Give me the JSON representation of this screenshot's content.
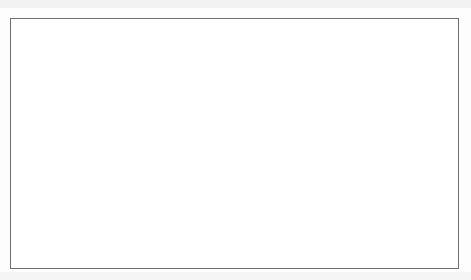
{
  "figure": {
    "background_color": "#ffffff",
    "border_color": "#6e6e6e"
  },
  "chart_data": {
    "type": "line",
    "title": "",
    "xlabel": "Year",
    "ylabel": "Rate (%)",
    "xlim": [
      1962,
      2009
    ],
    "ylim": [
      0,
      20
    ],
    "ytick_step": 2,
    "yticks": [
      0,
      2,
      4,
      6,
      8,
      10,
      12,
      14,
      16,
      18,
      20
    ],
    "xticks": [
      1962,
      1967,
      1972,
      1977,
      1982,
      1987,
      1992,
      1997,
      2002,
      2007
    ],
    "grid": false,
    "legend_position": "top-right",
    "x": [
      1962,
      1963,
      1964,
      1965,
      1966,
      1967,
      1968,
      1969,
      1970,
      1971,
      1972,
      1973,
      1974,
      1975,
      1976,
      1977,
      1978,
      1979,
      1980,
      1981,
      1982,
      1983,
      1984,
      1985,
      1986,
      1987,
      1988,
      1989,
      1990,
      1991,
      1992,
      1993,
      1994,
      1995,
      1996,
      1997,
      1998,
      1999,
      2000,
      2001,
      2002,
      2003,
      2004,
      2005,
      2006,
      2007,
      2008,
      2009
    ],
    "series": [
      {
        "name": "Inflation Rate",
        "color": "#1a1a1a",
        "marker": "diamond",
        "values": [
          1.7,
          1.7,
          2.0,
          3.2,
          3.4,
          4.1,
          3.9,
          4.8,
          1.3,
          5.1,
          5.0,
          12.3,
          9.4,
          5.8,
          9.4,
          8.5,
          9.7,
          11.2,
          12.2,
          9.2,
          4.5,
          3.8,
          4.4,
          4.2,
          4.1,
          4.0,
          5.1,
          5.0,
          3.9,
          2.2,
          1.8,
          0.1,
          1.9,
          2.1,
          0.8,
          1.1,
          2.0,
          3.2,
          3.0,
          0.8,
          3.9,
          2.0,
          2.2,
          2.2,
          1.8,
          2.4,
          1.2,
          1.3
        ],
        "legend_label": "Inflation Rate"
      },
      {
        "name": "Nominal Interest Rate",
        "color": "#7f7f7f",
        "marker": "square",
        "values": [
          4.1,
          3.6,
          3.8,
          3.9,
          5.0,
          4.6,
          6.2,
          7.1,
          6.0,
          3.5,
          3.5,
          5.5,
          7.7,
          7.3,
          8.8,
          7.3,
          8.5,
          11.6,
          12.7,
          17.8,
          13.6,
          9.2,
          11.0,
          9.4,
          8.9,
          8.1,
          9.4,
          12.0,
          12.8,
          8.7,
          6.5,
          4.8,
          5.5,
          4.1,
          3.2,
          4.6,
          4.6,
          5.4,
          3.4,
          2.6,
          2.9,
          2.2,
          2.3,
          2.8,
          4.1,
          4.1,
          2.3,
          0.3
        ],
        "legend_label": "Nominal Interest Rate"
      }
    ]
  },
  "legend": {
    "entries": [
      {
        "label": "Inflation Rate"
      },
      {
        "label": "Nominal Interest Rate"
      }
    ]
  },
  "axis": {
    "y_title": "Rate (%)",
    "x_title": "Year"
  }
}
